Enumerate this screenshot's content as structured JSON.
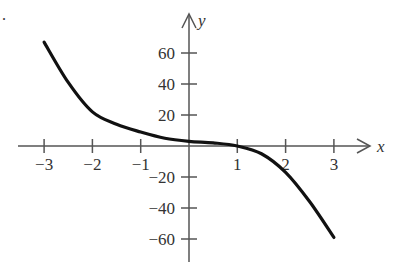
{
  "chart_data": {
    "type": "line",
    "title": "",
    "xlabel": "x",
    "ylabel": "y",
    "xlim": [
      -3,
      3
    ],
    "ylim": [
      -60,
      60
    ],
    "grid": false,
    "legend": null,
    "x_ticks": [
      -3,
      -2,
      -1,
      1,
      2,
      3
    ],
    "x_tick_labels": [
      "−3",
      "−2",
      "−1",
      "1",
      "2",
      "3"
    ],
    "y_ticks": [
      60,
      40,
      20,
      -20,
      -40,
      -60
    ],
    "y_tick_labels": [
      "60",
      "40",
      "20",
      "−20",
      "−40",
      "−60"
    ],
    "series": [
      {
        "name": "f(x)",
        "x": [
          -3,
          -2.5,
          -2,
          -1.5,
          -1,
          -0.5,
          0,
          0.5,
          1,
          1.5,
          2,
          2.5,
          3
        ],
        "y": [
          67,
          41,
          22,
          14,
          9,
          5,
          3,
          2,
          0,
          -5,
          -17,
          -36,
          -59
        ]
      }
    ],
    "colors": {
      "curve": "#111111",
      "axes": "#555555"
    }
  },
  "labels": {
    "corner_mark": "."
  }
}
